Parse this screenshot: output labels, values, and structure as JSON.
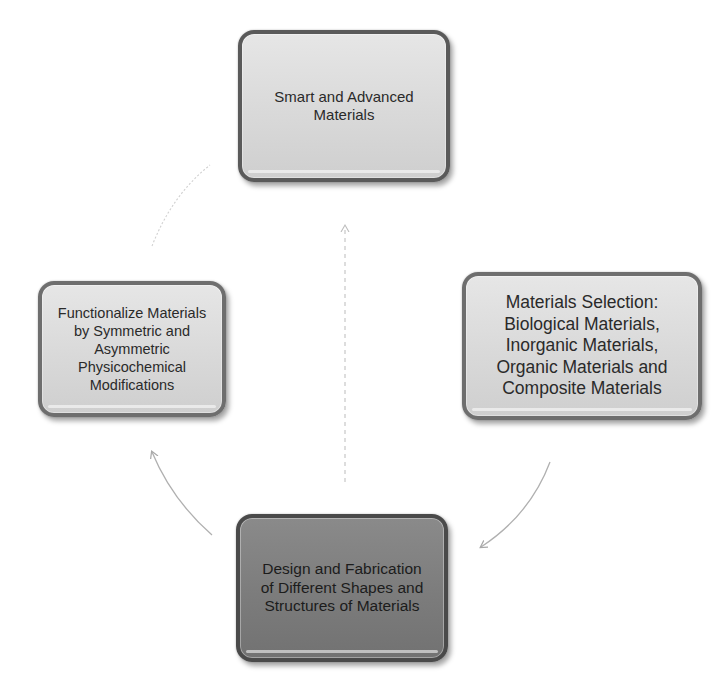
{
  "diagram": {
    "type": "cycle",
    "nodes": [
      {
        "id": "top",
        "label": "Smart and Advanced Materials",
        "lines": [
          "Smart and Advanced",
          "Materials"
        ],
        "fill": "#dcdcdc",
        "border": "#5a5a5a"
      },
      {
        "id": "right",
        "label": "Materials Selection: Biological Materials, Inorganic Materials, Organic Materials and Composite Materials",
        "lines": [
          "Materials Selection:",
          "Biological Materials,",
          "Inorganic Materials,",
          "Organic Materials and",
          "Composite Materials"
        ],
        "fill": "#dcdcdc",
        "border": "#6e6e6e"
      },
      {
        "id": "bottom",
        "label": "Design and Fabrication of Different Shapes and Structures of Materials",
        "lines": [
          "Design and Fabrication",
          "of Different Shapes and",
          "Structures of Materials"
        ],
        "fill": "#7e7e7e",
        "border": "#4a4a4a"
      },
      {
        "id": "left",
        "label": "Functionalize Materials by Symmetric and Asymmetric Physicochemical Modifications",
        "lines": [
          "Functionalize Materials",
          "by Symmetric and",
          "Asymmetric",
          "Physicochemical",
          "Modifications"
        ],
        "fill": "#dcdcdc",
        "border": "#6e6e6e"
      }
    ],
    "edges": [
      {
        "from": "right",
        "to": "bottom",
        "style": "solid-curved-arrow"
      },
      {
        "from": "bottom",
        "to": "left",
        "style": "solid-curved-arrow"
      },
      {
        "from": "left",
        "to": "top",
        "style": "dotted-curve"
      },
      {
        "from": "bottom",
        "to": "top",
        "style": "dashed-straight-arrow"
      }
    ],
    "colors": {
      "background": "#ffffff",
      "connector": "#b4b4b4",
      "connector_faint": "#d2d2d2",
      "text": "#2a2a2a"
    }
  }
}
